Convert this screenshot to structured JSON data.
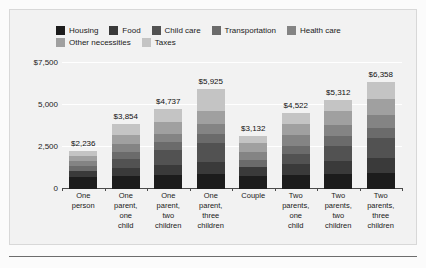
{
  "chart_data": {
    "type": "bar",
    "subtype": "stacked-bar",
    "title": "",
    "xlabel": "",
    "ylabel": "",
    "ylim": [
      0,
      7500
    ],
    "grid": true,
    "legend_position": "top",
    "ytick_labels": [
      "$7,500",
      "5,000",
      "2,500",
      "0"
    ],
    "ytick_values": [
      7500,
      5000,
      2500,
      0
    ],
    "categories": [
      "One person",
      "One parent, one child",
      "One parent, two children",
      "One parent, three children",
      "Couple",
      "Two parents, one child",
      "Two parents, two children",
      "Two parents, three children"
    ],
    "category_lines": [
      [
        "One",
        "person"
      ],
      [
        "One",
        "parent,",
        "one",
        "child"
      ],
      [
        "One",
        "parent,",
        "two",
        "children"
      ],
      [
        "One",
        "parent,",
        "three",
        "children"
      ],
      [
        "Couple"
      ],
      [
        "Two",
        "parents,",
        "one",
        "child"
      ],
      [
        "Two",
        "parents,",
        "two",
        "children"
      ],
      [
        "Two",
        "parents,",
        "three",
        "children"
      ]
    ],
    "totals": [
      2236,
      3854,
      4737,
      5925,
      3132,
      4522,
      5312,
      6358
    ],
    "total_labels": [
      "$2,236",
      "$3,854",
      "$4,737",
      "$5,925",
      "$3,132",
      "$4,522",
      "$5,312",
      "$6,358"
    ],
    "series": [
      {
        "name": "Housing",
        "color": "#1c1c1c",
        "values": [
          740,
          800,
          840,
          880,
          800,
          860,
          900,
          940
        ]
      },
      {
        "name": "Food",
        "color": "#3a3a3a",
        "values": [
          300,
          430,
          560,
          700,
          520,
          640,
          780,
          920
        ]
      },
      {
        "name": "Child care",
        "color": "#525252",
        "values": [
          0,
          560,
          900,
          1180,
          0,
          560,
          900,
          1180
        ]
      },
      {
        "name": "Transportation",
        "color": "#6b6b6b",
        "values": [
          330,
          420,
          470,
          520,
          430,
          520,
          560,
          600
        ]
      },
      {
        "name": "Health care",
        "color": "#848484",
        "values": [
          290,
          460,
          520,
          600,
          480,
          610,
          680,
          760
        ]
      },
      {
        "name": "Other necessities",
        "color": "#a0a0a0",
        "values": [
          330,
          560,
          670,
          790,
          520,
          700,
          810,
          930
        ]
      },
      {
        "name": "Taxes",
        "color": "#c4c4c4",
        "values": [
          246,
          624,
          777,
          1255,
          382,
          632,
          682,
          1028
        ]
      }
    ]
  },
  "legend": {
    "rows": [
      [
        "Housing",
        "Food",
        "Child care",
        "Transportation",
        "Health care"
      ],
      [
        "Other necessities",
        "Taxes"
      ]
    ]
  }
}
